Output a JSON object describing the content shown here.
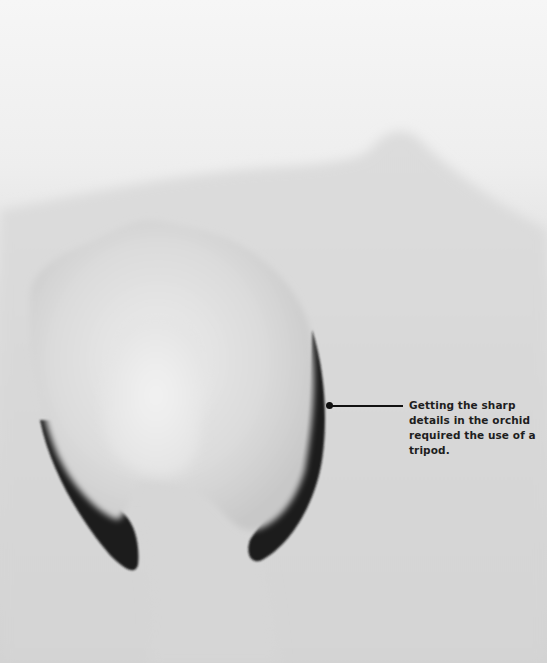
{
  "image": {
    "subject": "Close-up grayscale photograph of an orchid petal/lip against a soft white background",
    "palette": {
      "background_top": "#f4f4f4",
      "background_mid": "#dcdcdc",
      "petal_light": "#e9e9e9",
      "petal_shadow": "#c9c9c9",
      "dark_edge": "#1a1a1a"
    }
  },
  "callout": {
    "text": "Getting the sharp details in the orchid required the use of a tripod.",
    "marker_color": "#111111"
  }
}
